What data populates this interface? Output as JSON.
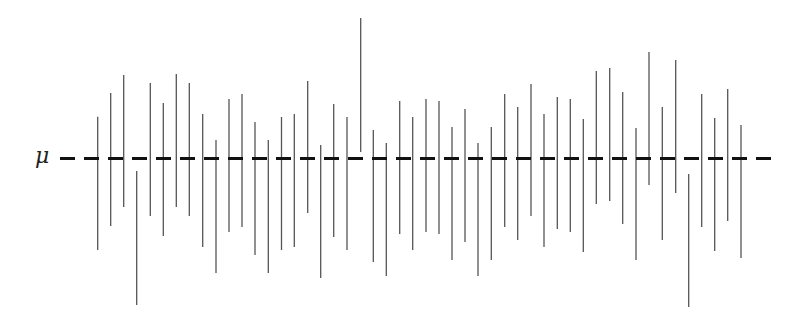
{
  "chart_data": {
    "type": "interval",
    "title": "",
    "reference_line": {
      "label": "μ",
      "y_pixel": 158.5,
      "style": "dashed",
      "x_start": 60,
      "x_end": 772,
      "dash_length": 15,
      "gap_length": 9,
      "color": "#111111",
      "stroke_width": 3
    },
    "interval_style": {
      "color": "#555555",
      "stroke_width": 1.3,
      "half_length_px": 66.5
    },
    "units": "pixel offset of interval center above μ (positive = above, negative = below)",
    "n_intervals": 50,
    "n_missing_mu": 3,
    "intervals": [
      {
        "x": 97.7,
        "top": 116.7,
        "bottom": 250.0,
        "center_offset": -24.8
      },
      {
        "x": 110.7,
        "top": 93.0,
        "bottom": 226.0,
        "center_offset": -1.0
      },
      {
        "x": 123.7,
        "top": 75.0,
        "bottom": 207.0,
        "center_offset": 17.5
      },
      {
        "x": 136.7,
        "top": 171.0,
        "bottom": 305.0,
        "center_offset": -79.5,
        "covers_mu": false
      },
      {
        "x": 150.3,
        "top": 83.0,
        "bottom": 216.0,
        "center_offset": 9.0
      },
      {
        "x": 163.3,
        "top": 103.0,
        "bottom": 236.0,
        "center_offset": -11.0
      },
      {
        "x": 176.3,
        "top": 74.0,
        "bottom": 207.0,
        "center_offset": 18.0
      },
      {
        "x": 189.3,
        "top": 83.0,
        "bottom": 216.0,
        "center_offset": 9.0
      },
      {
        "x": 202.7,
        "top": 114.0,
        "bottom": 247.0,
        "center_offset": -22.0
      },
      {
        "x": 216.0,
        "top": 140.0,
        "bottom": 273.0,
        "center_offset": -48.0
      },
      {
        "x": 229.0,
        "top": 99.0,
        "bottom": 232.0,
        "center_offset": -7.0
      },
      {
        "x": 242.0,
        "top": 94.0,
        "bottom": 227.0,
        "center_offset": -2.0
      },
      {
        "x": 255.0,
        "top": 122.0,
        "bottom": 255.0,
        "center_offset": -30.0
      },
      {
        "x": 268.3,
        "top": 140.0,
        "bottom": 273.0,
        "center_offset": -48.0
      },
      {
        "x": 281.5,
        "top": 117.0,
        "bottom": 250.0,
        "center_offset": -25.0
      },
      {
        "x": 294.3,
        "top": 114.0,
        "bottom": 247.0,
        "center_offset": -22.0
      },
      {
        "x": 307.7,
        "top": 81.0,
        "bottom": 213.0,
        "center_offset": 11.5
      },
      {
        "x": 320.7,
        "top": 145.0,
        "bottom": 278.0,
        "center_offset": -53.0
      },
      {
        "x": 333.7,
        "top": 104.0,
        "bottom": 237.0,
        "center_offset": -12.0
      },
      {
        "x": 347.0,
        "top": 117.0,
        "bottom": 250.0,
        "center_offset": -25.0
      },
      {
        "x": 360.7,
        "top": 18.0,
        "bottom": 152.0,
        "center_offset": 73.5,
        "covers_mu": false
      },
      {
        "x": 373.3,
        "top": 130.0,
        "bottom": 262.0,
        "center_offset": -37.5
      },
      {
        "x": 386.3,
        "top": 143.0,
        "bottom": 276.0,
        "center_offset": -51.0
      },
      {
        "x": 399.7,
        "top": 101.0,
        "bottom": 234.0,
        "center_offset": -9.0
      },
      {
        "x": 412.7,
        "top": 117.0,
        "bottom": 250.0,
        "center_offset": -25.0
      },
      {
        "x": 426.0,
        "top": 99.0,
        "bottom": 232.0,
        "center_offset": -7.0
      },
      {
        "x": 439.0,
        "top": 101.0,
        "bottom": 234.0,
        "center_offset": -9.0
      },
      {
        "x": 452.0,
        "top": 127.0,
        "bottom": 260.0,
        "center_offset": -35.0
      },
      {
        "x": 465.0,
        "top": 109.0,
        "bottom": 242.0,
        "center_offset": -17.0
      },
      {
        "x": 478.0,
        "top": 143.0,
        "bottom": 276.0,
        "center_offset": -51.0
      },
      {
        "x": 491.3,
        "top": 127.0,
        "bottom": 260.0,
        "center_offset": -35.0
      },
      {
        "x": 504.7,
        "top": 94.0,
        "bottom": 227.0,
        "center_offset": -2.0
      },
      {
        "x": 517.7,
        "top": 107.0,
        "bottom": 240.0,
        "center_offset": -15.0
      },
      {
        "x": 531.0,
        "top": 84.0,
        "bottom": 216.0,
        "center_offset": 8.5
      },
      {
        "x": 544.0,
        "top": 114.0,
        "bottom": 247.0,
        "center_offset": -22.0
      },
      {
        "x": 557.3,
        "top": 97.0,
        "bottom": 229.0,
        "center_offset": -4.5
      },
      {
        "x": 570.3,
        "top": 99.0,
        "bottom": 232.0,
        "center_offset": -7.0
      },
      {
        "x": 583.3,
        "top": 119.0,
        "bottom": 252.0,
        "center_offset": -27.0
      },
      {
        "x": 596.3,
        "top": 71.0,
        "bottom": 204.0,
        "center_offset": 21.0
      },
      {
        "x": 609.7,
        "top": 68.0,
        "bottom": 201.0,
        "center_offset": 24.0
      },
      {
        "x": 622.7,
        "top": 92.0,
        "bottom": 224.0,
        "center_offset": 0.5
      },
      {
        "x": 636.0,
        "top": 128.0,
        "bottom": 260.0,
        "center_offset": -35.5
      },
      {
        "x": 649.0,
        "top": 52.0,
        "bottom": 185.0,
        "center_offset": 40.0
      },
      {
        "x": 662.3,
        "top": 107.0,
        "bottom": 240.0,
        "center_offset": -15.0
      },
      {
        "x": 675.7,
        "top": 60.0,
        "bottom": 193.0,
        "center_offset": 32.0
      },
      {
        "x": 688.7,
        "top": 174.0,
        "bottom": 307.0,
        "center_offset": -82.0,
        "covers_mu": false
      },
      {
        "x": 701.7,
        "top": 94.0,
        "bottom": 227.0,
        "center_offset": -2.0
      },
      {
        "x": 714.7,
        "top": 118.0,
        "bottom": 251.0,
        "center_offset": -26.0
      },
      {
        "x": 727.7,
        "top": 89.0,
        "bottom": 221.0,
        "center_offset": 3.5
      },
      {
        "x": 741.0,
        "top": 125.0,
        "bottom": 258.0,
        "center_offset": -33.0
      }
    ]
  }
}
